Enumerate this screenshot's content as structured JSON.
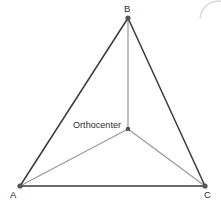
{
  "figure": {
    "kind": "geometry-diagram",
    "background_color": "#ffffff",
    "width": 221,
    "height": 204
  },
  "colors": {
    "side_stroke": "#3a3a3a",
    "cevian_stroke": "#9a9a9a",
    "vertex_fill": "#555555",
    "orthocenter_fill": "#555555",
    "label_color": "#2b2b2b",
    "artifact_stroke": "#d8d8d8"
  },
  "vertices": [
    {
      "id": "A",
      "label": "A",
      "x": 20,
      "y": 186,
      "label_x": 10,
      "label_y": 190
    },
    {
      "id": "B",
      "label": "B",
      "x": 128,
      "y": 18,
      "label_x": 124,
      "label_y": 4
    },
    {
      "id": "C",
      "label": "C",
      "x": 205,
      "y": 186,
      "label_x": 204,
      "label_y": 190
    }
  ],
  "points": [
    {
      "id": "H",
      "label": "Orthocenter",
      "x": 128,
      "y": 129,
      "label_x": 73,
      "label_y": 121
    }
  ],
  "sides": [
    {
      "id": "AB",
      "from": "A",
      "to": "B",
      "x1": 20,
      "y1": 186,
      "x2": 128,
      "y2": 18
    },
    {
      "id": "BC",
      "from": "B",
      "to": "C",
      "x1": 128,
      "y1": 18,
      "x2": 205,
      "y2": 186
    },
    {
      "id": "AC",
      "from": "A",
      "to": "C",
      "x1": 20,
      "y1": 186,
      "x2": 205,
      "y2": 186
    }
  ],
  "cevians": [
    {
      "id": "BH",
      "from": "B",
      "to": "H",
      "x1": 128,
      "y1": 18,
      "x2": 128,
      "y2": 129
    },
    {
      "id": "AH",
      "from": "A",
      "to": "H",
      "x1": 20,
      "y1": 186,
      "x2": 128,
      "y2": 129
    },
    {
      "id": "CH",
      "from": "C",
      "to": "H",
      "x1": 205,
      "y1": 186,
      "x2": 128,
      "y2": 129
    }
  ],
  "artifact": {
    "id": "corner-arc",
    "description": "faint curved arc fragment clipped at the top-right corner",
    "path": "M 221 1 Q 203 1 200 18"
  }
}
